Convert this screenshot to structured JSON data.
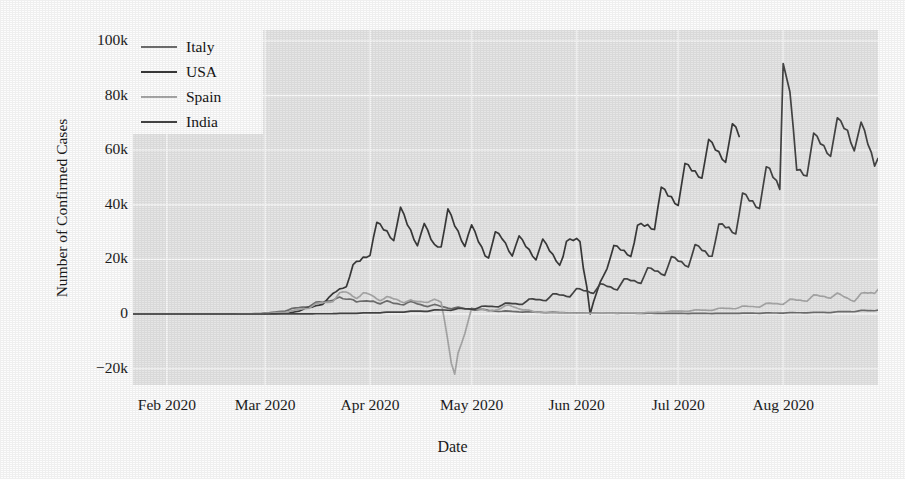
{
  "chart_data": {
    "type": "line",
    "title": "",
    "xlabel": "Date",
    "ylabel": "Number of Confirmed Cases",
    "grid": true,
    "legend_position": "upper left",
    "xlim": [
      "2020-01-22",
      "2020-08-29"
    ],
    "ylim": [
      -26000,
      104000
    ],
    "yticks": [
      -20000,
      0,
      20000,
      40000,
      60000,
      80000,
      100000
    ],
    "ytick_labels": [
      "−20k",
      "0",
      "20k",
      "40k",
      "60k",
      "80k",
      "100k"
    ],
    "xticks": [
      "2020-02-01",
      "2020-03-01",
      "2020-04-01",
      "2020-05-01",
      "2020-06-01",
      "2020-07-01",
      "2020-08-01"
    ],
    "xtick_labels": [
      "Feb 2020",
      "Mar 2020",
      "Apr 2020",
      "May 2020",
      "Jun 2020",
      "Jul 2020",
      "Aug 2020"
    ],
    "colors": {
      "Italy": "#6f6f6f",
      "USA": "#3a3a3a",
      "Spain": "#a8a8a8",
      "India": "#444444",
      "plot_background": "#e6e6e6",
      "grid": "#fafafa",
      "figure_background": "#fdfdfd",
      "text": "#1c1c1c"
    },
    "series": [
      {
        "name": "Italy",
        "color": "#6f6f6f",
        "x": [
          "2020-01-22",
          "2020-02-01",
          "2020-02-11",
          "2020-02-21",
          "2020-02-26",
          "2020-03-02",
          "2020-03-07",
          "2020-03-11",
          "2020-03-15",
          "2020-03-18",
          "2020-03-21",
          "2020-03-24",
          "2020-03-27",
          "2020-03-30",
          "2020-04-02",
          "2020-04-05",
          "2020-04-08",
          "2020-04-12",
          "2020-04-16",
          "2020-04-20",
          "2020-04-25",
          "2020-05-01",
          "2020-05-10",
          "2020-05-20",
          "2020-06-01",
          "2020-06-15",
          "2020-07-01",
          "2020-07-15",
          "2020-08-01",
          "2020-08-15",
          "2020-08-29"
        ],
        "y": [
          0,
          0,
          0,
          0,
          80,
          340,
          1250,
          2300,
          3500,
          4200,
          5986,
          5000,
          5900,
          4050,
          4780,
          4300,
          3800,
          4100,
          3490,
          3000,
          2300,
          1800,
          1000,
          700,
          400,
          300,
          200,
          200,
          400,
          600,
          1400
        ]
      },
      {
        "name": "USA",
        "color": "#3a3a3a",
        "x": [
          "2020-01-22",
          "2020-02-15",
          "2020-03-01",
          "2020-03-08",
          "2020-03-15",
          "2020-03-20",
          "2020-03-25",
          "2020-03-29",
          "2020-04-02",
          "2020-04-06",
          "2020-04-10",
          "2020-04-15",
          "2020-04-20",
          "2020-04-24",
          "2020-04-30",
          "2020-05-05",
          "2020-05-10",
          "2020-05-15",
          "2020-05-22",
          "2020-05-28",
          "2020-06-02",
          "2020-06-05",
          "2020-06-10",
          "2020-06-18",
          "2020-06-25",
          "2020-07-01",
          "2020-07-08",
          "2020-07-14",
          "2020-07-19"
        ],
        "y": [
          0,
          0,
          50,
          300,
          2500,
          5400,
          12000,
          19000,
          28000,
          31000,
          33500,
          30000,
          26000,
          33000,
          29000,
          24000,
          27000,
          24500,
          23500,
          21000,
          30000,
          0,
          20000,
          26000,
          39000,
          46000,
          56000,
          61000,
          65000
        ]
      },
      {
        "name": "Spain",
        "color": "#a8a8a8",
        "x": [
          "2020-01-22",
          "2020-02-20",
          "2020-03-01",
          "2020-03-08",
          "2020-03-14",
          "2020-03-20",
          "2020-03-25",
          "2020-03-29",
          "2020-04-01",
          "2020-04-05",
          "2020-04-09",
          "2020-04-14",
          "2020-04-18",
          "2020-04-22",
          "2020-04-26",
          "2020-05-01",
          "2020-05-06",
          "2020-05-12",
          "2020-05-20",
          "2020-06-01",
          "2020-06-20",
          "2020-07-10",
          "2020-07-25",
          "2020-08-05",
          "2020-08-15",
          "2020-08-22",
          "2020-08-29"
        ],
        "y": [
          0,
          0,
          100,
          800,
          2500,
          4800,
          7900,
          6500,
          7000,
          5500,
          5400,
          4200,
          5100,
          4200,
          -22000,
          2500,
          1000,
          3000,
          600,
          300,
          400,
          1500,
          3000,
          5000,
          7000,
          5500,
          9000
        ]
      },
      {
        "name": "India",
        "color": "#444444",
        "x": [
          "2020-01-22",
          "2020-03-01",
          "2020-03-20",
          "2020-04-01",
          "2020-04-15",
          "2020-05-01",
          "2020-05-15",
          "2020-06-01",
          "2020-06-15",
          "2020-07-01",
          "2020-07-10",
          "2020-07-20",
          "2020-07-28",
          "2020-07-31",
          "2020-08-01",
          "2020-08-05",
          "2020-08-10",
          "2020-08-15",
          "2020-08-20",
          "2020-08-25",
          "2020-08-29"
        ],
        "y": [
          0,
          0,
          100,
          400,
          1000,
          2000,
          4000,
          8000,
          11000,
          19000,
          24000,
          38000,
          49000,
          50000,
          98000,
          52000,
          60000,
          64000,
          68000,
          63000,
          57000
        ]
      }
    ],
    "annotations": [
      {
        "label": "India anomaly spike",
        "x": "2020-08-01",
        "y": 98000
      },
      {
        "label": "Spain negative-correction spike",
        "x": "2020-04-25",
        "y": -22000
      },
      {
        "label": "USA reporting dip",
        "x": "2020-06-05",
        "y": 0
      }
    ]
  },
  "legend": {
    "items": [
      {
        "label": "Italy"
      },
      {
        "label": "USA"
      },
      {
        "label": "Spain"
      },
      {
        "label": "India"
      }
    ]
  },
  "axes": {
    "y_title": "Number of Confirmed Cases",
    "x_title": "Date"
  }
}
